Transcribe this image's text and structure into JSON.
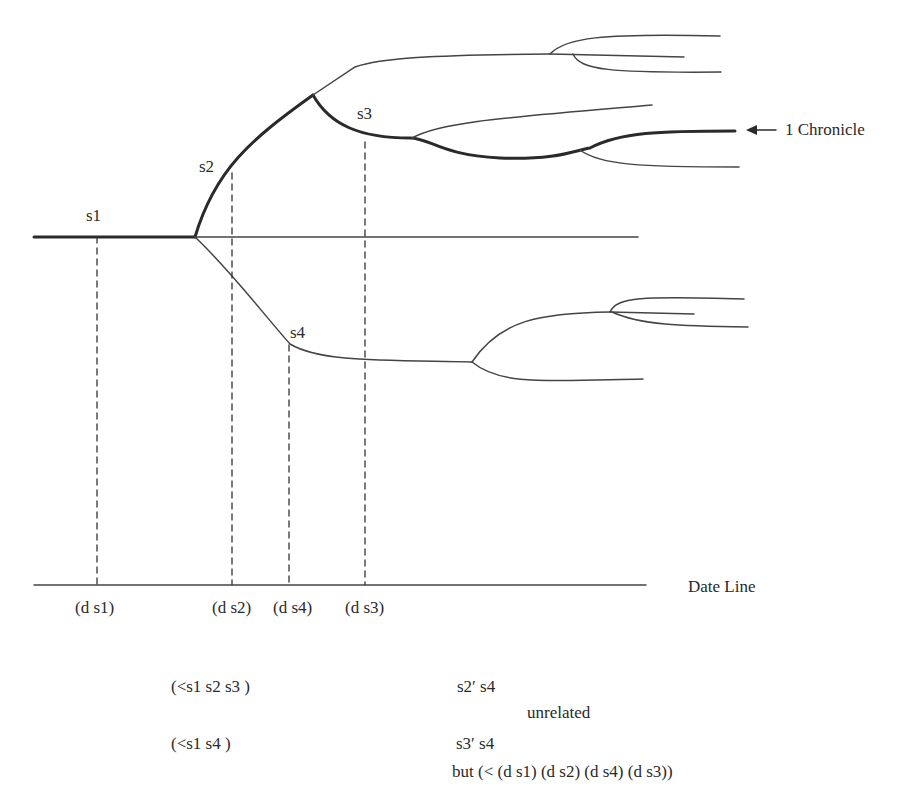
{
  "diagram": {
    "state_labels": {
      "s1": "s1",
      "s2": "s2",
      "s3": "s3",
      "s4": "s4"
    },
    "chronicle_label": "1 Chronicle",
    "chronicle_arrow": "←",
    "date_line_label": "Date Line",
    "date_ticks": [
      "(d s1)",
      "(d s2)",
      "(d s4)",
      "(d s3)"
    ],
    "relations": {
      "order_1": "(<s1 s2 s3 )",
      "order_2": "(<s1 s4 )",
      "unrelated_1": "s2′ s4",
      "unrelated_label": "unrelated",
      "unrelated_2": "s3′ s4",
      "but_clause": "but (< (d s1) (d s2) (d s4) (d s3))"
    },
    "colors": {
      "line": "#2a2a2a",
      "thin_line": "#444444",
      "background": "#ffffff"
    }
  }
}
